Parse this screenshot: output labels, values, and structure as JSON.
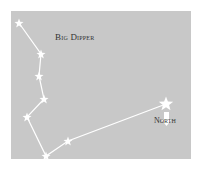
{
  "diagram": {
    "title": "Big Dipper",
    "direction_label": "North",
    "colors": {
      "panel": "#c8c8c8",
      "line": "#ffffff",
      "star": "#ffffff",
      "text": "#333333"
    },
    "stars": [
      {
        "x": 19,
        "y": 23,
        "size": 4
      },
      {
        "x": 41,
        "y": 54,
        "size": 4
      },
      {
        "x": 39,
        "y": 76,
        "size": 4
      },
      {
        "x": 44,
        "y": 99,
        "size": 4
      },
      {
        "x": 27,
        "y": 117,
        "size": 4
      },
      {
        "x": 46,
        "y": 156,
        "size": 4
      },
      {
        "x": 68,
        "y": 141,
        "size": 4
      },
      {
        "x": 166,
        "y": 104,
        "size": 6
      }
    ],
    "arrow": {
      "x": 167,
      "y1": 112,
      "y2": 125,
      "direction": "down"
    }
  }
}
